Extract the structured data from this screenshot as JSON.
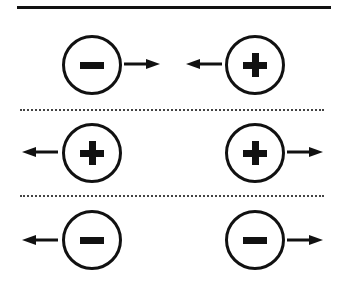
{
  "diagram": {
    "type": "electric-charge-interaction",
    "colors": {
      "stroke": "#111111",
      "divider": "#444444",
      "background": "#ffffff"
    },
    "rows": [
      {
        "label": "opposite charges attract",
        "left": {
          "sign": "-",
          "arrow": "right"
        },
        "right": {
          "sign": "+",
          "arrow": "left"
        }
      },
      {
        "label": "like positive charges repel",
        "left": {
          "sign": "+",
          "arrow": "left"
        },
        "right": {
          "sign": "+",
          "arrow": "right"
        }
      },
      {
        "label": "like negative charges repel",
        "left": {
          "sign": "-",
          "arrow": "left"
        },
        "right": {
          "sign": "-",
          "arrow": "right"
        }
      }
    ]
  }
}
